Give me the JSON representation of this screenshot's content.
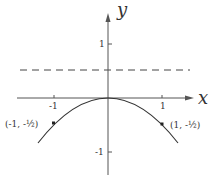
{
  "diagram": {
    "title": "",
    "x_axis": {
      "label": "x",
      "ticks": [
        {
          "value": -1,
          "label": "-1"
        },
        {
          "value": 1,
          "label": "1"
        }
      ]
    },
    "y_axis": {
      "label": "y",
      "ticks": [
        {
          "value": 1,
          "label": "1"
        },
        {
          "value": -1,
          "label": "-1"
        }
      ]
    },
    "curve": {
      "description": "downward parabola through origin",
      "equation": "y = -x^2/2"
    },
    "dashed_line": {
      "y": 0.5,
      "style": "dashed"
    },
    "points": [
      {
        "x": -1,
        "y": -0.5,
        "label": "(-1, -½)"
      },
      {
        "x": 1,
        "y": -0.5,
        "label": "(1, -½)"
      }
    ]
  },
  "colors": {
    "ink": "#333333",
    "background": "#ffffff"
  }
}
